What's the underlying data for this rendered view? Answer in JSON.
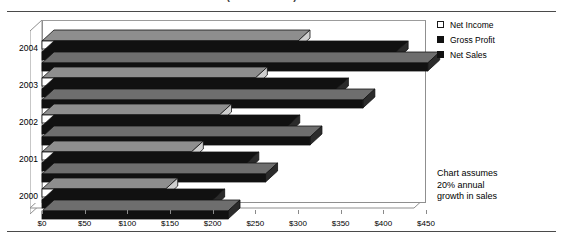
{
  "page": {
    "title_fragment": "OPERATING PERFORMANCE PROJECTIONS (in thousands)"
  },
  "legend": {
    "position": "right",
    "items": [
      {
        "label": "Net Income",
        "swatch": "hollow-square-icon",
        "color": "#ffffff"
      },
      {
        "label": "Gross Profit",
        "swatch": "filled-square-icon",
        "color": "#111111"
      },
      {
        "label": "Net Sales",
        "swatch": "filled-square-icon",
        "color": "#111111"
      }
    ]
  },
  "annotation": {
    "line1": "Chart assumes",
    "line2": "20% annual",
    "line3": "growth in sales"
  },
  "axis": {
    "x_ticks": [
      "$0",
      "$50",
      "$100",
      "$150",
      "$200",
      "$250",
      "$300",
      "$350",
      "$400",
      "$450"
    ],
    "y_ticks": [
      "2004",
      "2003",
      "2002",
      "2001",
      "2000"
    ]
  },
  "chart_data": {
    "type": "bar",
    "orientation": "horizontal",
    "style": "3d-clustered-bar",
    "title": "OPERATING PERFORMANCE PROJECTIONS (in thousands)",
    "xlabel": "",
    "ylabel": "",
    "xlim": [
      0,
      450
    ],
    "xtick_step": 50,
    "grid": false,
    "categories": [
      "2000",
      "2001",
      "2002",
      "2003",
      "2004"
    ],
    "category_order_top_to_bottom": [
      "2004",
      "2003",
      "2002",
      "2001",
      "2000"
    ],
    "series": [
      {
        "name": "Net Income",
        "color": "#ffffff",
        "values": [
          145,
          175,
          208,
          250,
          300
        ]
      },
      {
        "name": "Gross Profit",
        "color": "#111111",
        "values": [
          200,
          240,
          288,
          345,
          415
        ]
      },
      {
        "name": "Net Sales",
        "color": "#111111",
        "values": [
          218,
          262,
          314,
          376,
          452
        ]
      }
    ],
    "notes": "Chart assumes 20% annual growth in sales"
  }
}
